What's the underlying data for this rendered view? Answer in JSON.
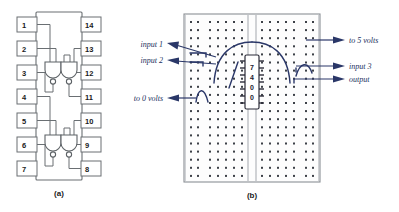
{
  "figure": {
    "panels": [
      {
        "caption": "(a)",
        "name": "dip-package-pinout"
      },
      {
        "caption": "(b)",
        "name": "breadboard-wiring"
      }
    ]
  },
  "panel_a": {
    "caption": "(a)",
    "pins_left": [
      "1",
      "2",
      "3",
      "4",
      "5",
      "6",
      "7"
    ],
    "pins_right": [
      "14",
      "13",
      "12",
      "11",
      "10",
      "9",
      "8"
    ],
    "gate_count": 4,
    "gate_type": "NAND"
  },
  "panel_b": {
    "caption": "(b)",
    "chip_label_chars": [
      "7",
      "4",
      "0",
      "0"
    ],
    "chip_label": "7400",
    "labels_left": [
      {
        "text": "input 1",
        "name": "label-input-1"
      },
      {
        "text": "input 2",
        "name": "label-input-2"
      },
      {
        "text": "to 0 volts",
        "name": "label-to-0-volts"
      }
    ],
    "labels_right": [
      {
        "text": "to 5 volts",
        "name": "label-to-5-volts"
      },
      {
        "text": "input 3",
        "name": "label-input-3"
      },
      {
        "text": "output",
        "name": "label-output"
      }
    ]
  },
  "colors": {
    "wire": "#2a3768",
    "annotation_text": "#22305e",
    "package_outline": "#6a6f73",
    "breadboard_border": "#8b9095",
    "dot": "#3d4148",
    "background": "#ffffff"
  }
}
